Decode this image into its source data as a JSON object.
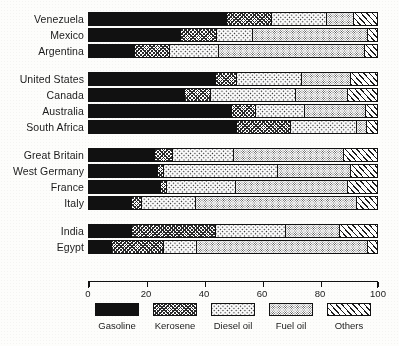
{
  "chart_data": {
    "type": "bar",
    "orientation": "horizontal",
    "stacked": true,
    "percent": true,
    "title": "",
    "xlabel": "",
    "ylabel": "",
    "xlim": [
      0,
      100
    ],
    "xticks": [
      0,
      20,
      40,
      60,
      80,
      100
    ],
    "xticklabels": [
      "0",
      "20",
      "40",
      "60",
      "80",
      "100"
    ],
    "grid": false,
    "legend_position": "bottom",
    "series": [
      {
        "name": "Gasoline",
        "key": "gasoline",
        "pattern": "solid-black"
      },
      {
        "name": "Kerosene",
        "key": "kerosene",
        "pattern": "dense-crosshatch"
      },
      {
        "name": "Diesel oil",
        "key": "diesel_oil",
        "pattern": "coarse-dots"
      },
      {
        "name": "Fuel oil",
        "key": "fuel_oil",
        "pattern": "fine-stipple"
      },
      {
        "name": "Others",
        "key": "others",
        "pattern": "diagonal-hatch"
      }
    ],
    "categories": [
      "Venezuela",
      "Mexico",
      "Argentina",
      "United States",
      "Canada",
      "Australia",
      "South Africa",
      "Great Britain",
      "West Germany",
      "France",
      "Italy",
      "India",
      "Egypt"
    ],
    "groups": [
      {
        "name": "group-1",
        "categories": [
          "Venezuela",
          "Mexico",
          "Argentina"
        ]
      },
      {
        "name": "group-2",
        "categories": [
          "United States",
          "Canada",
          "Australia",
          "South Africa"
        ]
      },
      {
        "name": "group-3",
        "categories": [
          "Great Britain",
          "West Germany",
          "France",
          "Italy"
        ]
      },
      {
        "name": "group-4",
        "categories": [
          "India",
          "Egypt"
        ]
      }
    ],
    "rows": [
      {
        "label": "Venezuela",
        "group": 0,
        "values": [
          48.0,
          15.5,
          19.0,
          9.5,
          8.0
        ]
      },
      {
        "label": "Mexico",
        "group": 0,
        "values": [
          32.0,
          12.5,
          12.5,
          40.0,
          3.0
        ]
      },
      {
        "label": "Argentina",
        "group": 0,
        "values": [
          16.0,
          12.0,
          17.0,
          51.0,
          4.0
        ]
      },
      {
        "label": "United States",
        "group": 1,
        "values": [
          44.0,
          7.5,
          22.5,
          17.0,
          9.0
        ]
      },
      {
        "label": "Canada",
        "group": 1,
        "values": [
          33.5,
          9.0,
          29.5,
          18.0,
          10.0
        ]
      },
      {
        "label": "Australia",
        "group": 1,
        "values": [
          49.5,
          8.5,
          17.0,
          21.0,
          4.0
        ]
      },
      {
        "label": "South Africa",
        "group": 1,
        "values": [
          51.5,
          18.5,
          23.0,
          3.5,
          3.5
        ]
      },
      {
        "label": "Great Britain",
        "group": 2,
        "values": [
          23.0,
          6.0,
          21.5,
          38.0,
          11.5
        ]
      },
      {
        "label": "West Germany",
        "group": 2,
        "values": [
          24.0,
          2.0,
          39.5,
          25.5,
          9.0
        ]
      },
      {
        "label": "France",
        "group": 2,
        "values": [
          25.0,
          2.0,
          24.0,
          39.0,
          10.0
        ]
      },
      {
        "label": "Italy",
        "group": 2,
        "values": [
          15.0,
          3.5,
          18.5,
          56.0,
          7.0
        ]
      },
      {
        "label": "India",
        "group": 3,
        "values": [
          15.0,
          29.0,
          24.5,
          18.5,
          13.0
        ]
      },
      {
        "label": "Egypt",
        "group": 3,
        "values": [
          8.0,
          18.0,
          11.5,
          59.5,
          3.0
        ]
      }
    ],
    "legend": [
      "Gasoline",
      "Kerosene",
      "Diesel oil",
      "Fuel oil",
      "Others"
    ],
    "colors": {
      "gasoline": "#111111",
      "kerosene": "#ffffff",
      "diesel_oil": "#ffffff",
      "fuel_oil": "#ffffff",
      "others": "#ffffff",
      "outline": "#111111",
      "background": "#fdfdfb"
    }
  }
}
